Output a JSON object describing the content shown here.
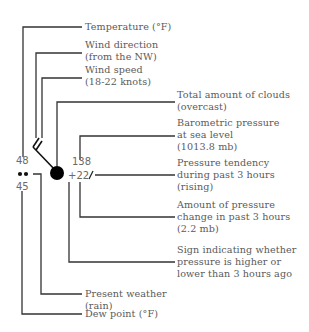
{
  "diagram": {
    "station_values": {
      "temperature": "48",
      "dew_point": "45",
      "present_weather_symbol": "rain",
      "present_weather_glyph": "••",
      "pressure": "138",
      "pressure_change": "+22",
      "pressure_tendency_glyph": "/",
      "cloud_cover": "overcast",
      "wind_direction": "NW",
      "wind_speed": "18-22 knots"
    },
    "labels": {
      "temperature": {
        "line1": "Temperature (°F)"
      },
      "wind_direction": {
        "line1": "Wind direction",
        "line2": "(from the NW)"
      },
      "wind_speed": {
        "line1": "Wind speed",
        "line2": "(18-22 knots)"
      },
      "clouds": {
        "line1": "Total amount of clouds",
        "line2": "(overcast)"
      },
      "barometric": {
        "line1": "Barometric pressure",
        "line2": "at sea level",
        "line3": "(1013.8 mb)"
      },
      "tendency": {
        "line1": "Pressure tendency",
        "line2": "during past 3 hours",
        "line3": "(rising)"
      },
      "pressure_amount": {
        "line1": "Amount of pressure",
        "line2": "change in past 3 hours",
        "line3": "(2.2 mb)"
      },
      "pressure_sign": {
        "line1": "Sign indicating whether",
        "line2": "pressure is higher or",
        "line3": "lower than 3 hours ago"
      },
      "present_weather": {
        "line1": "Present weather",
        "line2": "(rain)"
      },
      "dew_point": {
        "line1": "Dew point (°F)"
      }
    },
    "colors": {
      "line": "#333333",
      "text": "#5a5a5a",
      "symbol": "#000000"
    }
  }
}
